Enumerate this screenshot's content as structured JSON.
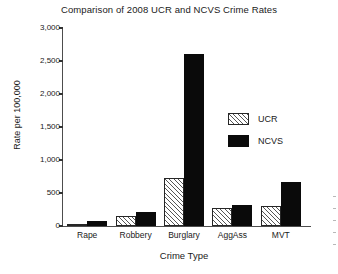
{
  "chart_data": {
    "type": "bar",
    "title": "Comparison of 2008 UCR and NCVS Crime Rates",
    "xlabel": "Crime Type",
    "ylabel": "Rate per 100,000",
    "categories": [
      "Rape",
      "Robbery",
      "Burglary",
      "AggAss",
      "MVT"
    ],
    "series": [
      {
        "name": "UCR",
        "values": [
          30,
          145,
          730,
          275,
          300
        ]
      },
      {
        "name": "NCVS",
        "values": [
          80,
          210,
          2600,
          320,
          660
        ]
      }
    ],
    "ylim": [
      0,
      3000
    ],
    "yticks": [
      0,
      500,
      1000,
      1500,
      2000,
      2500,
      3000
    ],
    "ytick_labels": [
      "0",
      "500",
      "1,000",
      "1,500",
      "2,000",
      "2,500",
      "3,000"
    ],
    "grid": false,
    "legend_position": "center-right",
    "colors": {
      "ucr": "#ffffff",
      "ucr_hatch": "#555555",
      "ncvs": "#0a0a0a",
      "axis": "#4d4d4d",
      "text": "#1a1a1a"
    }
  }
}
